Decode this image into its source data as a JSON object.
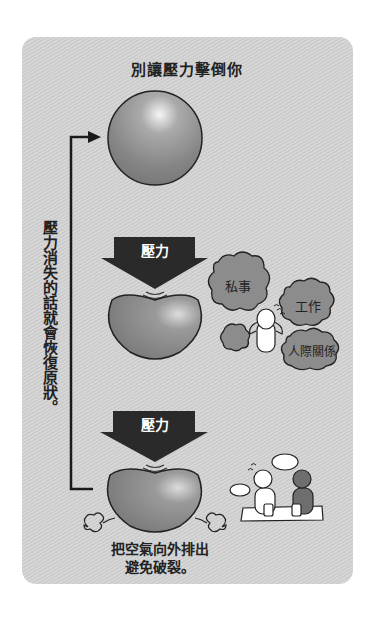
{
  "title": "別讓壓力擊倒你",
  "side_note": "壓力消失的話就會恢復原狀。",
  "pressure_label_1": "壓力",
  "pressure_label_2": "壓力",
  "clouds": {
    "private": "私事",
    "work": "工作",
    "relationships": "人際關係"
  },
  "caption_line1": "把空氣向外排出",
  "caption_line2": "避免破裂。",
  "colors": {
    "panel": "#cfcfcf",
    "sphere": "#8a8a8a",
    "arrow": "#2a2a2a",
    "cloud": "#8c8c8c",
    "text": "#222222"
  }
}
